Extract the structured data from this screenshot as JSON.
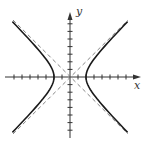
{
  "figure": {
    "equation": "x^2/a^2 - y^2/b^2 = 1",
    "x_axis_label": "x",
    "y_axis_label": "y",
    "ticks_per_side_x": 7,
    "ticks_per_side_y": 7,
    "vertex_units": 2,
    "asymptotes": [
      "y = x",
      "y = -x"
    ],
    "colors": {
      "curve": "#1a1a1a",
      "axis": "#333333",
      "asymptote": "#666666",
      "background": "#ffffff"
    }
  }
}
